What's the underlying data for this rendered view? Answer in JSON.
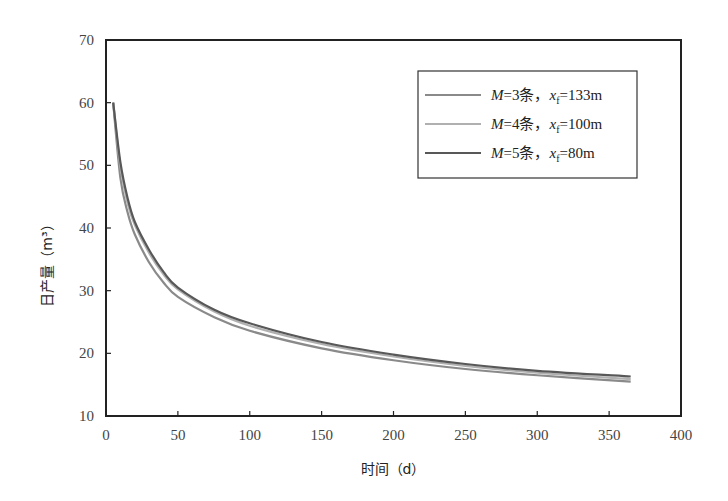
{
  "chart_data": {
    "type": "line",
    "title": "",
    "xlabel": "时间（d）",
    "ylabel": "日产量（m³）",
    "xlim": [
      0,
      400
    ],
    "ylim": [
      10,
      70
    ],
    "xticks": [
      0,
      50,
      100,
      150,
      200,
      250,
      300,
      350,
      400
    ],
    "yticks": [
      10,
      20,
      30,
      40,
      50,
      60,
      70
    ],
    "grid": false,
    "legend_position": "upper right",
    "x": [
      5,
      10,
      15,
      20,
      30,
      40,
      50,
      75,
      100,
      150,
      200,
      250,
      300,
      365
    ],
    "series": [
      {
        "name": "M=3条，xf=133m",
        "label_parts": {
          "m": "M",
          "eq1": "=3条，",
          "x": "x",
          "sub": "f",
          "eq2": "=133m"
        },
        "color": "#8a8a8a",
        "values": [
          60,
          48,
          42.5,
          39,
          34.5,
          31.3,
          29,
          25.8,
          23.6,
          20.8,
          18.9,
          17.5,
          16.5,
          15.5
        ]
      },
      {
        "name": "M=4条，xf=100m",
        "label_parts": {
          "m": "M",
          "eq1": "=4条，",
          "x": "x",
          "sub": "f",
          "eq2": "=100m"
        },
        "color": "#b0b0b0",
        "values": [
          60,
          49.8,
          44,
          40.5,
          36,
          32.6,
          30.2,
          26.7,
          24.4,
          21.5,
          19.5,
          18.0,
          16.9,
          15.9
        ]
      },
      {
        "name": "M=5条，xf=80m",
        "label_parts": {
          "m": "M",
          "eq1": "=5条，",
          "x": "x",
          "sub": "f",
          "eq2": "=80m"
        },
        "color": "#585858",
        "values": [
          60,
          50.5,
          44.8,
          41,
          36.5,
          33,
          30.5,
          27,
          24.8,
          21.8,
          19.8,
          18.3,
          17.2,
          16.3
        ]
      }
    ]
  }
}
